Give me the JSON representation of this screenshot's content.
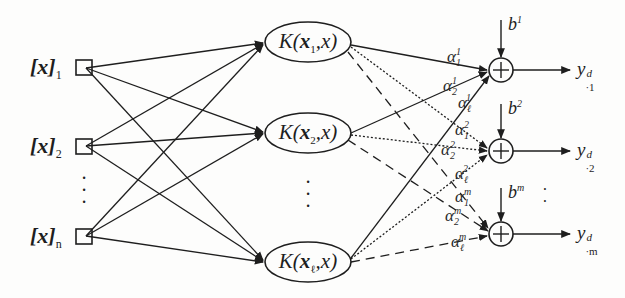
{
  "diagram": {
    "type": "svm-network",
    "inputs": [
      {
        "base": "[x]",
        "sub": "1"
      },
      {
        "base": "[x]",
        "sub": "2"
      },
      {
        "base": "[x]",
        "sub": "n"
      }
    ],
    "input_ellipsis": "⋮",
    "kernels": [
      {
        "prefix": "K(",
        "var": "x",
        "sub": "1",
        "suffix": ",x)"
      },
      {
        "prefix": "K(",
        "var": "x",
        "sub": "2",
        "suffix": ",x)"
      },
      {
        "prefix": "K(",
        "var": "x",
        "sub": "ℓ",
        "suffix": ",x)"
      }
    ],
    "kernel_ellipsis": "⋮",
    "biases": [
      {
        "base": "b",
        "sup": "1"
      },
      {
        "base": "b",
        "sup": "2"
      },
      {
        "base": "b",
        "sup": "m"
      }
    ],
    "sum_symbol": "+",
    "outputs": [
      {
        "base": "y",
        "sup": "d",
        "sub": "·1"
      },
      {
        "base": "y",
        "sup": "d",
        "sub": "·2"
      },
      {
        "base": "y",
        "sup": "d",
        "sub": "·m"
      }
    ],
    "output_ellipsis": "⋮",
    "weights": [
      {
        "base": "α",
        "sub": "1",
        "sup": "1"
      },
      {
        "base": "α",
        "sub": "2",
        "sup": "1"
      },
      {
        "base": "α",
        "sub": "ℓ",
        "sup": "1"
      },
      {
        "base": "α",
        "sub": "1",
        "sup": "2"
      },
      {
        "base": "α",
        "sub": "2",
        "sup": "2"
      },
      {
        "base": "α",
        "sub": "ℓ",
        "sup": "2"
      },
      {
        "base": "α",
        "sub": "1",
        "sup": "m"
      },
      {
        "base": "α",
        "sub": "2",
        "sup": "m"
      },
      {
        "base": "α",
        "sub": "ℓ",
        "sup": "m"
      }
    ],
    "line_styles": {
      "output_1": "solid",
      "output_2": "dotted",
      "output_m": "dashed"
    },
    "colors": {
      "ink": "#1e1e1e",
      "background": "#fdfdfc"
    }
  }
}
